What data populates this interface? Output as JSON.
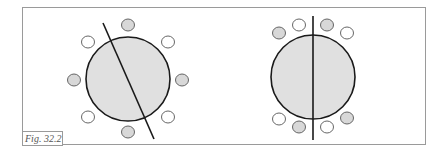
{
  "figure": {
    "label": "Fig. 32.2"
  },
  "colors": {
    "outline": "#1a1a1a",
    "large_fill": "#e0e0e0",
    "small_gray_fill": "#d8d8d8",
    "small_white_fill": "#ffffff",
    "frame": "#9a9a9a"
  },
  "diagrams": [
    {
      "name": "left",
      "large_circle": {
        "cx": 128,
        "cy": 79,
        "r": 42
      },
      "line": {
        "x1": 103,
        "y1": 23,
        "x2": 154,
        "y2": 139
      },
      "small_circles": [
        {
          "cx": 128,
          "cy": 25,
          "fill": "gray"
        },
        {
          "cx": 88,
          "cy": 42,
          "fill": "white"
        },
        {
          "cx": 168,
          "cy": 42,
          "fill": "white"
        },
        {
          "cx": 74,
          "cy": 80,
          "fill": "gray"
        },
        {
          "cx": 182,
          "cy": 80,
          "fill": "gray"
        },
        {
          "cx": 88,
          "cy": 117,
          "fill": "white"
        },
        {
          "cx": 168,
          "cy": 117,
          "fill": "white"
        },
        {
          "cx": 128,
          "cy": 132,
          "fill": "gray"
        }
      ]
    },
    {
      "name": "right",
      "large_circle": {
        "cx": 313,
        "cy": 77,
        "r": 42
      },
      "line": {
        "x1": 313,
        "y1": 16,
        "x2": 313,
        "y2": 140
      },
      "small_circles": [
        {
          "cx": 279,
          "cy": 33,
          "fill": "gray"
        },
        {
          "cx": 299,
          "cy": 25,
          "fill": "white"
        },
        {
          "cx": 327,
          "cy": 25,
          "fill": "gray"
        },
        {
          "cx": 347,
          "cy": 33,
          "fill": "white"
        },
        {
          "cx": 279,
          "cy": 119,
          "fill": "white"
        },
        {
          "cx": 299,
          "cy": 127,
          "fill": "gray"
        },
        {
          "cx": 327,
          "cy": 127,
          "fill": "white"
        },
        {
          "cx": 347,
          "cy": 118,
          "fill": "gray"
        }
      ]
    }
  ]
}
